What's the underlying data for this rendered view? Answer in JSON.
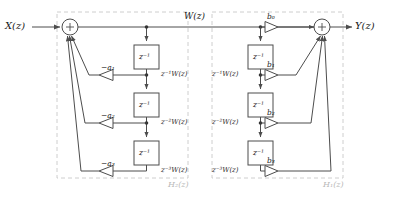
{
  "figure": {
    "type": "block-diagram",
    "stroke_color": "#4d4d4d",
    "dashed_color": "#c8c8c8",
    "text_color": "#1a1a1a",
    "subsystem_label_color": "#b8b8b8",
    "background": "#ffffff"
  },
  "io": {
    "input_label": "X(z)",
    "output_label": "Y(z)",
    "intermediate_label": "W(z)"
  },
  "adders": [
    {
      "name": "input-adder",
      "symbol": "+",
      "cx": 70,
      "cy": 27,
      "r": 8
    },
    {
      "name": "output-adder",
      "symbol": "+",
      "cx": 322,
      "cy": 27,
      "r": 8
    }
  ],
  "subsystems": [
    {
      "name": "feedback-section",
      "label": "H₂(z)",
      "x": 57,
      "y": 12,
      "w": 131,
      "h": 166
    },
    {
      "name": "feedforward-section",
      "label": "H₁(z)",
      "x": 212,
      "y": 12,
      "w": 131,
      "h": 166
    }
  ],
  "delay_blocks": {
    "label": "z⁻¹",
    "left": [
      {
        "name": "delay-left-1",
        "x": 134,
        "y": 45,
        "w": 25,
        "h": 24
      },
      {
        "name": "delay-left-2",
        "x": 134,
        "y": 93,
        "w": 25,
        "h": 24
      },
      {
        "name": "delay-left-3",
        "x": 134,
        "y": 141,
        "w": 25,
        "h": 24
      }
    ],
    "right": [
      {
        "name": "delay-right-1",
        "x": 248,
        "y": 45,
        "w": 25,
        "h": 24
      },
      {
        "name": "delay-right-2",
        "x": 248,
        "y": 93,
        "w": 25,
        "h": 24
      },
      {
        "name": "delay-right-3",
        "x": 248,
        "y": 141,
        "w": 25,
        "h": 24
      }
    ]
  },
  "signal_taps": {
    "left": [
      {
        "name": "tap-label-left-1",
        "text": "z⁻¹W(z)",
        "x": 161,
        "y": 77
      },
      {
        "name": "tap-label-left-2",
        "text": "z⁻²W(z)",
        "x": 161,
        "y": 125
      },
      {
        "name": "tap-label-left-3",
        "text": "z⁻³W(z)",
        "x": 161,
        "y": 173
      }
    ],
    "right": [
      {
        "name": "tap-label-right-1",
        "text": "z⁻¹W(z)",
        "x": 214,
        "y": 77
      },
      {
        "name": "tap-label-right-2",
        "text": "z⁻²W(z)",
        "x": 214,
        "y": 125
      },
      {
        "name": "tap-label-right-3",
        "text": "z⁻³W(z)",
        "x": 214,
        "y": 173
      }
    ]
  },
  "gains": {
    "feedback": [
      {
        "name": "gain-a1",
        "label": "−a₁",
        "tri_apex_x": 99,
        "tri_base_x": 113,
        "cy": 75
      },
      {
        "name": "gain-a2",
        "label": "−a₂",
        "tri_apex_x": 99,
        "tri_base_x": 113,
        "cy": 123
      },
      {
        "name": "gain-a3",
        "label": "−a₃",
        "tri_apex_x": 99,
        "tri_base_x": 113,
        "cy": 171
      }
    ],
    "feedforward": [
      {
        "name": "gain-b0",
        "label": "b₀",
        "tri_base_x": 265,
        "tri_apex_x": 278,
        "cy": 27
      },
      {
        "name": "gain-b1",
        "label": "b₁",
        "tri_base_x": 265,
        "tri_apex_x": 278,
        "cy": 75
      },
      {
        "name": "gain-b2",
        "label": "b₂",
        "tri_base_x": 265,
        "tri_apex_x": 278,
        "cy": 123
      },
      {
        "name": "gain-b3",
        "label": "b₃",
        "tri_base_x": 265,
        "tri_apex_x": 278,
        "cy": 171
      }
    ]
  },
  "coefficient_values": {
    "feedback_coefficients": [
      "-a1",
      "-a2",
      "-a3"
    ],
    "feedforward_coefficients": [
      "b0",
      "b1",
      "b2",
      "b3"
    ],
    "delay_operator": "z^-1",
    "order": 3
  }
}
